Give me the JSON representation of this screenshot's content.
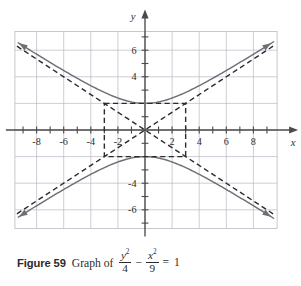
{
  "figure": {
    "number_label": "Figure 59",
    "caption_lead": "Graph of",
    "equation": {
      "term1_numerator": "y",
      "term1_numerator_exp": "2",
      "term1_denominator": "4",
      "operator": "−",
      "term2_numerator": "x",
      "term2_numerator_exp": "2",
      "term2_denominator": "9",
      "equals": "=",
      "result": "1"
    }
  },
  "chart_data": {
    "type": "line",
    "xlabel": "x",
    "ylabel": "y",
    "xlim": [
      -9.6,
      9.8
    ],
    "ylim": [
      -7.4,
      7.4
    ],
    "grid": true,
    "grid_color": "#b9b9c4",
    "axis_color": "#4a4a4a",
    "curve_color": "#6e6e76",
    "dash_color": "#2b2b2b",
    "x_tick_labels": [
      "-8",
      "-6",
      "-4",
      "-2",
      "2",
      "4",
      "6",
      "8"
    ],
    "x_tick_values": [
      -8,
      -6,
      -4,
      -2,
      2,
      4,
      6,
      8
    ],
    "y_tick_labels": [
      "6",
      "4",
      "-4",
      "-6"
    ],
    "y_tick_values": [
      6,
      4,
      -4,
      -6
    ],
    "x_minor_ticks": [
      -9,
      -7,
      -5,
      -3,
      -1,
      1,
      3,
      5,
      7,
      9
    ],
    "y_minor_ticks": [
      -7,
      -5,
      -3,
      -2,
      -1,
      1,
      2,
      3,
      5,
      7
    ],
    "a": 2,
    "b": 3,
    "center": [
      0,
      0
    ],
    "vertices": [
      [
        0,
        2
      ],
      [
        0,
        -2
      ]
    ],
    "asymptote_slopes": [
      0.6667,
      -0.6667
    ],
    "fundamental_rectangle": {
      "x": [
        -3,
        3
      ],
      "y": [
        -2,
        2
      ]
    },
    "series": [
      {
        "name": "upper branch",
        "style": "solid",
        "points": [
          [
            -9.0,
            6.3246
          ],
          [
            -8.0,
            5.696
          ],
          [
            -7.0,
            5.0772
          ],
          [
            -6.0,
            4.4721
          ],
          [
            -5.0,
            3.8873
          ],
          [
            -4.0,
            3.3333
          ],
          [
            -3.0,
            2.8284
          ],
          [
            -2.0,
            2.4037
          ],
          [
            -1.0,
            2.1082
          ],
          [
            0.0,
            2.0
          ],
          [
            1.0,
            2.1082
          ],
          [
            2.0,
            2.4037
          ],
          [
            3.0,
            2.8284
          ],
          [
            4.0,
            3.3333
          ],
          [
            5.0,
            3.8873
          ],
          [
            6.0,
            4.4721
          ],
          [
            7.0,
            5.0772
          ],
          [
            8.0,
            5.696
          ],
          [
            9.0,
            6.3246
          ]
        ]
      },
      {
        "name": "lower branch",
        "style": "solid",
        "points": [
          [
            -9.0,
            -6.3246
          ],
          [
            -8.0,
            -5.696
          ],
          [
            -7.0,
            -5.0772
          ],
          [
            -6.0,
            -4.4721
          ],
          [
            -5.0,
            -3.8873
          ],
          [
            -4.0,
            -3.3333
          ],
          [
            -3.0,
            -2.8284
          ],
          [
            -2.0,
            -2.4037
          ],
          [
            -1.0,
            -2.1082
          ],
          [
            0.0,
            -2.0
          ],
          [
            1.0,
            -2.1082
          ],
          [
            2.0,
            -2.4037
          ],
          [
            3.0,
            -2.8284
          ],
          [
            4.0,
            -3.3333
          ],
          [
            5.0,
            -3.8873
          ],
          [
            6.0,
            -4.4721
          ],
          [
            7.0,
            -5.0772
          ],
          [
            8.0,
            -5.696
          ],
          [
            9.0,
            -6.3246
          ]
        ]
      },
      {
        "name": "asymptote y = 2x/3",
        "style": "dashed",
        "points": [
          [
            -9.4,
            -6.2667
          ],
          [
            9.4,
            6.2667
          ]
        ]
      },
      {
        "name": "asymptote y = -2x/3",
        "style": "dashed",
        "points": [
          [
            -9.4,
            6.2667
          ],
          [
            9.4,
            -6.2667
          ]
        ]
      }
    ]
  }
}
